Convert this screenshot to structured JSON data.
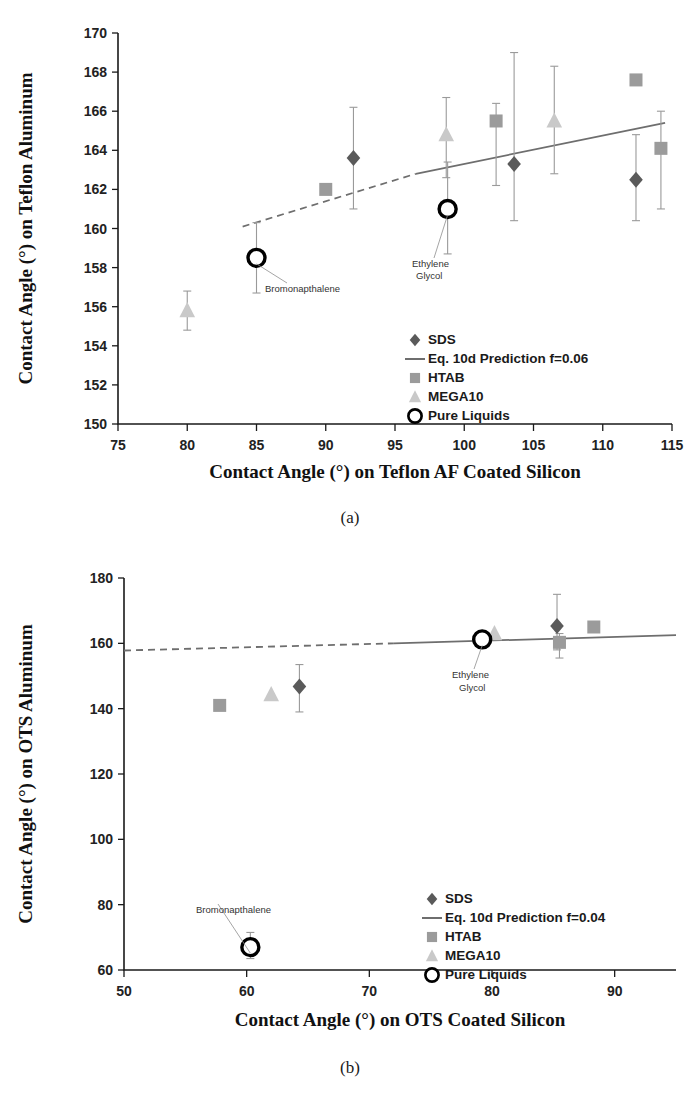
{
  "figure": {
    "subcaption_a": "(a)",
    "subcaption_b": "(b)"
  },
  "chart_data": [
    {
      "id": "panel-a",
      "type": "scatter",
      "title": "",
      "xlabel": "Contact Angle (°) on Teflon AF Coated Silicon",
      "ylabel": "Contact Angle (°) on Teflon Aluminum",
      "xlim": [
        75,
        115
      ],
      "ylim": [
        150,
        170
      ],
      "xticks": [
        75,
        80,
        85,
        90,
        95,
        100,
        105,
        110,
        115
      ],
      "yticks": [
        150,
        152,
        154,
        156,
        158,
        160,
        162,
        164,
        166,
        168,
        170
      ],
      "grid": false,
      "legend_position": "inside-bottom-right",
      "legend": [
        {
          "label": "SDS",
          "marker": "diamond",
          "color": "#5a5a5a"
        },
        {
          "label": "Eq. 10d Prediction f=0.06",
          "marker": "line",
          "color": "#6e6e6e"
        },
        {
          "label": "HTAB",
          "marker": "square",
          "color": "#9b9b9b"
        },
        {
          "label": "MEGA10",
          "marker": "triangle",
          "color": "#c9c9c9"
        },
        {
          "label": "Pure Liquids",
          "marker": "open-circle",
          "color": "#000000"
        }
      ],
      "series": [
        {
          "name": "SDS",
          "marker": "diamond",
          "color": "#5a5a5a",
          "points": [
            {
              "x": 92.0,
              "y": 163.6,
              "yerr_low": 161.0,
              "yerr_high": 166.2
            },
            {
              "x": 103.6,
              "y": 163.3,
              "yerr_low": 160.4,
              "yerr_high": 169.0
            },
            {
              "x": 112.4,
              "y": 162.5,
              "yerr_low": 160.4,
              "yerr_high": 164.8
            }
          ]
        },
        {
          "name": "HTAB",
          "marker": "square",
          "color": "#9b9b9b",
          "points": [
            {
              "x": 90.0,
              "y": 162.0,
              "yerr_low": 162.0,
              "yerr_high": 162.0
            },
            {
              "x": 102.3,
              "y": 165.5,
              "yerr_low": 162.2,
              "yerr_high": 166.4
            },
            {
              "x": 112.4,
              "y": 167.6,
              "yerr_low": 167.6,
              "yerr_high": 167.6
            },
            {
              "x": 114.2,
              "y": 164.1,
              "yerr_low": 161.0,
              "yerr_high": 166.0
            }
          ]
        },
        {
          "name": "MEGA10",
          "marker": "triangle",
          "color": "#c9c9c9",
          "points": [
            {
              "x": 80.0,
              "y": 155.8,
              "yerr_low": 154.8,
              "yerr_high": 156.8
            },
            {
              "x": 98.7,
              "y": 164.8,
              "yerr_low": 162.6,
              "yerr_high": 166.7
            },
            {
              "x": 106.5,
              "y": 165.5,
              "yerr_low": 162.8,
              "yerr_high": 168.3
            }
          ]
        },
        {
          "name": "Pure Liquids",
          "marker": "open-circle",
          "color": "#000000",
          "points": [
            {
              "x": 85.0,
              "y": 158.5,
              "yerr_low": 156.7,
              "yerr_high": 160.3,
              "annotation": "Bromonapthalene"
            },
            {
              "x": 98.8,
              "y": 161.0,
              "yerr_low": 158.7,
              "yerr_high": 163.4,
              "annotation": "Ethylene Glycol"
            }
          ]
        }
      ],
      "prediction_line": {
        "name": "Eq. 10d Prediction f=0.06",
        "solid_segment": [
          {
            "x": 96.5,
            "y": 162.8
          },
          {
            "x": 114.5,
            "y": 165.4
          }
        ],
        "dashed_segment": [
          {
            "x": 84.0,
            "y": 160.1
          },
          {
            "x": 96.5,
            "y": 162.8
          }
        ]
      },
      "annotations": [
        {
          "text": "Bromonapthalene",
          "x_px": 265,
          "y_px": 292,
          "leader_to_x": 85.0,
          "leader_to_y": 158.5
        },
        {
          "text": "Ethylene",
          "x_px": 412,
          "y_px": 267,
          "leader_to_x": 98.8,
          "leader_to_y": 161.0
        },
        {
          "text": "Glycol",
          "x_px": 416,
          "y_px": 279,
          "leader_to_x": null,
          "leader_to_y": null
        }
      ]
    },
    {
      "id": "panel-b",
      "type": "scatter",
      "title": "",
      "xlabel": "Contact Angle (°) on OTS Coated Silicon",
      "ylabel": "Contact Angle (°) on OTS Aluminum",
      "xlim": [
        50,
        95
      ],
      "ylim": [
        60,
        180
      ],
      "xticks": [
        50,
        60,
        70,
        80,
        90
      ],
      "yticks": [
        60,
        80,
        100,
        120,
        140,
        160,
        180
      ],
      "grid": false,
      "legend_position": "inside-bottom-right",
      "legend": [
        {
          "label": "SDS",
          "marker": "diamond",
          "color": "#5a5a5a"
        },
        {
          "label": "Eq. 10d Prediction f=0.04",
          "marker": "line",
          "color": "#6e6e6e"
        },
        {
          "label": "HTAB",
          "marker": "square",
          "color": "#9b9b9b"
        },
        {
          "label": "MEGA10",
          "marker": "triangle",
          "color": "#c9c9c9"
        },
        {
          "label": "Pure Liquids",
          "marker": "open-circle",
          "color": "#000000"
        }
      ],
      "series": [
        {
          "name": "SDS",
          "marker": "diamond",
          "color": "#5a5a5a",
          "points": [
            {
              "x": 64.3,
              "y": 146.8,
              "yerr_low": 139.0,
              "yerr_high": 153.5
            },
            {
              "x": 85.3,
              "y": 165.3,
              "yerr_low": 158.0,
              "yerr_high": 175.0
            }
          ]
        },
        {
          "name": "HTAB",
          "marker": "square",
          "color": "#9b9b9b",
          "points": [
            {
              "x": 57.8,
              "y": 141.0,
              "yerr_low": 141.0,
              "yerr_high": 141.0
            },
            {
              "x": 85.5,
              "y": 160.3,
              "yerr_low": 155.5,
              "yerr_high": 163.0
            },
            {
              "x": 88.3,
              "y": 165.0,
              "yerr_low": 165.0,
              "yerr_high": 165.0
            }
          ]
        },
        {
          "name": "MEGA10",
          "marker": "triangle",
          "color": "#c9c9c9",
          "points": [
            {
              "x": 62.0,
              "y": 144.3,
              "yerr_low": 144.3,
              "yerr_high": 144.3
            },
            {
              "x": 80.2,
              "y": 163.0,
              "yerr_low": 163.0,
              "yerr_high": 163.0
            }
          ]
        },
        {
          "name": "Pure Liquids",
          "marker": "open-circle",
          "color": "#000000",
          "points": [
            {
              "x": 60.3,
              "y": 67.0,
              "yerr_low": 63.5,
              "yerr_high": 71.5,
              "annotation": "Bromonapthalene"
            },
            {
              "x": 79.2,
              "y": 161.2,
              "yerr_low": 161.2,
              "yerr_high": 161.2,
              "annotation": "Ethylene Glycol"
            }
          ]
        }
      ],
      "prediction_line": {
        "name": "Eq. 10d Prediction f=0.04",
        "solid_segment": [
          {
            "x": 72.0,
            "y": 160.0
          },
          {
            "x": 95.0,
            "y": 162.5
          }
        ],
        "dashed_segment": [
          {
            "x": 50.0,
            "y": 157.8
          },
          {
            "x": 72.0,
            "y": 160.0
          }
        ]
      },
      "annotations": [
        {
          "text": "Ethylene",
          "x_px": 452,
          "y_px": 678,
          "leader_to_x": 79.2,
          "leader_to_y": 161.2
        },
        {
          "text": "Glycol",
          "x_px": 459,
          "y_px": 691,
          "leader_to_x": null,
          "leader_to_y": null
        },
        {
          "text": "Bromonapthalene",
          "x_px": 196,
          "y_px": 913,
          "leader_to_x": 60.3,
          "leader_to_y": 67.0
        }
      ]
    }
  ]
}
